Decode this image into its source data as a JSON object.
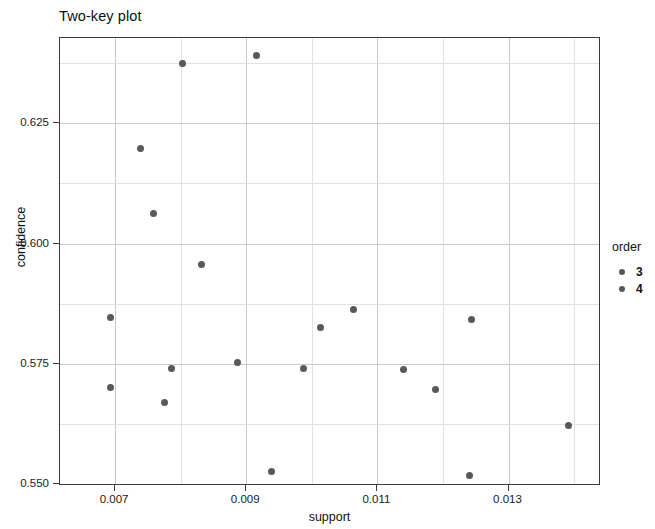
{
  "chart_data": {
    "type": "scatter",
    "title": "Two-key plot",
    "xlabel": "support",
    "ylabel": "confidence",
    "xlim": [
      0.00616,
      0.01441
    ],
    "ylim": [
      0.5496,
      0.6427
    ],
    "xticks": [
      0.007,
      0.009,
      0.011,
      0.013
    ],
    "xtick_labels": [
      "0.007",
      "0.009",
      "0.011",
      "0.013"
    ],
    "yticks": [
      0.55,
      0.575,
      0.6,
      0.625
    ],
    "ytick_labels": [
      "0.550",
      "0.575",
      "0.600",
      "0.625"
    ],
    "grid": true,
    "minor_grid": true,
    "legend": {
      "title": "order",
      "position": "right",
      "entries": [
        {
          "label": "3",
          "color": "#595959"
        },
        {
          "label": "4",
          "color": "#595959"
        }
      ]
    },
    "marker_color": "#595959",
    "points": [
      {
        "x": 0.00803,
        "y": 0.6375,
        "order": "3"
      },
      {
        "x": 0.00916,
        "y": 0.639,
        "order": "3"
      },
      {
        "x": 0.00739,
        "y": 0.6197,
        "order": "3"
      },
      {
        "x": 0.00759,
        "y": 0.6063,
        "order": "3"
      },
      {
        "x": 0.00831,
        "y": 0.5957,
        "order": "3"
      },
      {
        "x": 0.00693,
        "y": 0.5846,
        "order": "3"
      },
      {
        "x": 0.00693,
        "y": 0.5701,
        "order": "3"
      },
      {
        "x": 0.00786,
        "y": 0.5741,
        "order": "4"
      },
      {
        "x": 0.00775,
        "y": 0.567,
        "order": "4"
      },
      {
        "x": 0.00886,
        "y": 0.5752,
        "order": "4"
      },
      {
        "x": 0.00987,
        "y": 0.5741,
        "order": "4"
      },
      {
        "x": 0.00939,
        "y": 0.5527,
        "order": "4"
      },
      {
        "x": 0.01013,
        "y": 0.5826,
        "order": "4"
      },
      {
        "x": 0.01063,
        "y": 0.5862,
        "order": "4"
      },
      {
        "x": 0.01139,
        "y": 0.5739,
        "order": "4"
      },
      {
        "x": 0.01189,
        "y": 0.5697,
        "order": "4"
      },
      {
        "x": 0.01243,
        "y": 0.5843,
        "order": "4"
      },
      {
        "x": 0.0124,
        "y": 0.5518,
        "order": "4"
      },
      {
        "x": 0.01392,
        "y": 0.5622,
        "order": "4"
      }
    ]
  }
}
